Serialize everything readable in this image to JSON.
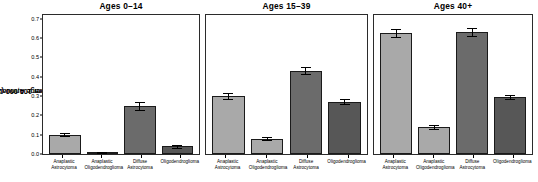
{
  "chart_data": {
    "type": "bar",
    "title": "",
    "ylabel": "Average Annual Age Adjusted\nIncidence per 100,000 (2010–2014)",
    "ylabel_line1": "Average Annual Age Adjusted",
    "ylabel_line2": "Incidence per 100,000 (2010–2014)",
    "xlabel": "",
    "ylim": [
      0,
      0.72
    ],
    "ytick_labels": [
      "0.0",
      "0.1",
      "0.2",
      "0.3",
      "0.4",
      "0.5",
      "0.6",
      "0.7"
    ],
    "ytick_values": [
      0.0,
      0.1,
      0.2,
      0.3,
      0.4,
      0.5,
      0.6,
      0.7
    ],
    "grid": false,
    "legend": "none",
    "categories": [
      "Anaplastic Astrocytoma",
      "Anaplastic Oligodendroglioma",
      "Diffuse Astrocytoma",
      "Oligodendroglioma"
    ],
    "category_lines": [
      [
        "Anaplastic",
        "Astrocytoma"
      ],
      [
        "Anaplastic",
        "Oligodendroglioma"
      ],
      [
        "Diffuse",
        "Astrocytoma"
      ],
      [
        "Oligodendroglioma",
        ""
      ]
    ],
    "panels": [
      {
        "title": "Ages 0–14",
        "values": [
          0.1,
          0.005,
          0.25,
          0.04
        ],
        "err_low": [
          0.092,
          0.003,
          0.228,
          0.033
        ],
        "err_high": [
          0.108,
          0.008,
          0.272,
          0.047
        ],
        "shades": [
          "light",
          "light",
          "dark",
          "darker"
        ]
      },
      {
        "title": "Ages 15–39",
        "values": [
          0.3,
          0.08,
          0.43,
          0.27
        ],
        "err_low": [
          0.286,
          0.071,
          0.412,
          0.258
        ],
        "err_high": [
          0.316,
          0.089,
          0.452,
          0.284
        ],
        "shades": [
          "light",
          "light",
          "dark",
          "darker"
        ]
      },
      {
        "title": "Ages 40+",
        "values": [
          0.625,
          0.14,
          0.63,
          0.295
        ],
        "err_low": [
          0.605,
          0.131,
          0.61,
          0.286
        ],
        "err_high": [
          0.645,
          0.15,
          0.651,
          0.305
        ],
        "shades": [
          "light",
          "light",
          "dark",
          "darker"
        ]
      }
    ]
  }
}
